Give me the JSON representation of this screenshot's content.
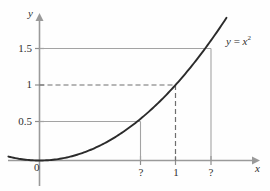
{
  "figure": {
    "axes": {
      "y_axis_label": "y",
      "x_axis_label": "x",
      "origin_label": "0"
    },
    "y_ticks": [
      {
        "label": "1.5",
        "value": 1.5
      },
      {
        "label": "1",
        "value": 1
      },
      {
        "label": "0.5",
        "value": 0.5
      }
    ],
    "x_ticks": [
      {
        "label": "?",
        "value": 0.7071
      },
      {
        "label": "1",
        "value": 1
      },
      {
        "label": "?",
        "value": 1.2247
      }
    ],
    "equation": {
      "lhs": "y",
      "eq": " = ",
      "rhs_base": "x",
      "rhs_exp": "2"
    }
  },
  "chart_data": {
    "type": "line",
    "title": "",
    "xlabel": "x",
    "ylabel": "y",
    "xlim": [
      -0.65,
      1.6
    ],
    "ylim": [
      -0.18,
      1.85
    ],
    "grid": false,
    "legend": "none",
    "series": [
      {
        "name": "y = x^2",
        "expression": "y = x^2",
        "x": [
          -0.62,
          -0.5,
          -0.4,
          -0.3,
          -0.2,
          -0.1,
          0,
          0.1,
          0.2,
          0.3,
          0.4,
          0.5,
          0.6,
          0.7071,
          0.8,
          0.9,
          1.0,
          1.1,
          1.2247,
          1.3,
          1.4
        ],
        "y": [
          0.3844,
          0.25,
          0.16,
          0.09,
          0.04,
          0.01,
          0,
          0.01,
          0.04,
          0.09,
          0.16,
          0.25,
          0.36,
          0.5,
          0.64,
          0.81,
          1.0,
          1.21,
          1.5,
          1.69,
          1.96
        ]
      }
    ],
    "annotations": [
      {
        "text": "y = x²",
        "type": "curve-label",
        "x": 1.35,
        "y": 1.58
      },
      {
        "text": "0",
        "type": "origin-label",
        "x": 0,
        "y": 0
      }
    ],
    "guide_lines": [
      {
        "style": "solid",
        "from_axis": "y",
        "y": 1.5,
        "to_x": 1.2247,
        "drop_to_axis": true,
        "x_tick_label": "?"
      },
      {
        "style": "dashed",
        "from_axis": "y",
        "y": 1.0,
        "to_x": 1.0,
        "drop_to_axis": true,
        "x_tick_label": "1"
      },
      {
        "style": "solid",
        "from_axis": "y",
        "y": 0.5,
        "to_x": 0.7071,
        "drop_to_axis": true,
        "x_tick_label": "?"
      }
    ],
    "x_tick_labels": [
      "?",
      "1",
      "?"
    ],
    "y_tick_labels": [
      "0.5",
      "1",
      "1.5"
    ]
  }
}
